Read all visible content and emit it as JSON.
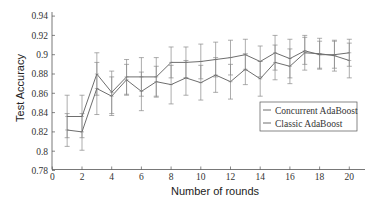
{
  "chart_data": {
    "type": "line",
    "title": "",
    "xlabel": "Number of rounds",
    "ylabel": "Test Accuracy",
    "xlim": [
      0,
      21
    ],
    "ylim": [
      0.78,
      0.95
    ],
    "xticks": [
      0,
      2,
      4,
      6,
      8,
      10,
      12,
      14,
      16,
      18,
      20
    ],
    "xtick_labels": [
      "0",
      "2",
      "4",
      "6",
      "8",
      "10",
      "12",
      "14",
      "16",
      "18",
      "20"
    ],
    "yticks": [
      0.78,
      0.8,
      0.82,
      0.84,
      0.86,
      0.88,
      0.9,
      0.92,
      0.94
    ],
    "ytick_labels": [
      "0.78",
      "0.8",
      "0.82",
      "0.84",
      "0.86",
      "0.88",
      "0.9",
      "0.92",
      "0.94"
    ],
    "grid": false,
    "legend_position": "lower right",
    "x": [
      1,
      2,
      3,
      4,
      5,
      6,
      7,
      8,
      9,
      10,
      11,
      12,
      13,
      14,
      15,
      16,
      17,
      18,
      19,
      20
    ],
    "series": [
      {
        "name": "Concurrent AdaBoost",
        "values": [
          0.836,
          0.836,
          0.88,
          0.861,
          0.877,
          0.877,
          0.877,
          0.892,
          0.892,
          0.893,
          0.895,
          0.897,
          0.9,
          0.893,
          0.902,
          0.896,
          0.904,
          0.9,
          0.9,
          0.902
        ],
        "errors": [
          0.022,
          0.022,
          0.022,
          0.022,
          0.018,
          0.02,
          0.02,
          0.016,
          0.016,
          0.018,
          0.018,
          0.018,
          0.016,
          0.016,
          0.018,
          0.02,
          0.014,
          0.014,
          0.014,
          0.014
        ]
      },
      {
        "name": "Classic AdaBoost",
        "values": [
          0.822,
          0.82,
          0.865,
          0.857,
          0.874,
          0.862,
          0.872,
          0.869,
          0.876,
          0.871,
          0.879,
          0.872,
          0.885,
          0.875,
          0.892,
          0.888,
          0.902,
          0.901,
          0.899,
          0.894
        ],
        "errors": [
          0.017,
          0.019,
          0.027,
          0.02,
          0.016,
          0.02,
          0.016,
          0.02,
          0.018,
          0.018,
          0.018,
          0.018,
          0.016,
          0.018,
          0.018,
          0.018,
          0.018,
          0.016,
          0.016,
          0.018
        ]
      }
    ]
  },
  "legend": {
    "items": [
      {
        "label": "Concurrent AdaBoost"
      },
      {
        "label": "Classic AdaBoost"
      }
    ]
  },
  "colors": {
    "axis": "#555555",
    "line": "#6e6e6e",
    "errorbar": "#8a8a8a",
    "legend_border": "#555555"
  }
}
